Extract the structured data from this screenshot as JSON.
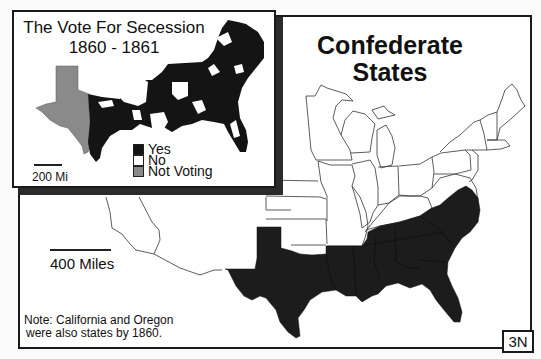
{
  "main_map": {
    "title_line1": "Confederate",
    "title_line2": "States",
    "scale_label": "400 Miles",
    "note_line1": "Note: California and Oregon",
    "note_line2": "were also states by 1860.",
    "map_id": "3N",
    "colors": {
      "confederate_fill": "#1c1c1c",
      "state_outline": "#333333",
      "background": "#ffffff"
    }
  },
  "inset": {
    "title_line1": "The Vote For Secession",
    "title_line2": "1860 - 1861",
    "scale_label": "200 Mi",
    "legend": [
      {
        "label": "Yes",
        "color": "#141414"
      },
      {
        "label": "No",
        "color": "#ffffff"
      },
      {
        "label": "Not Voting",
        "color": "#8a8a8a"
      }
    ]
  }
}
